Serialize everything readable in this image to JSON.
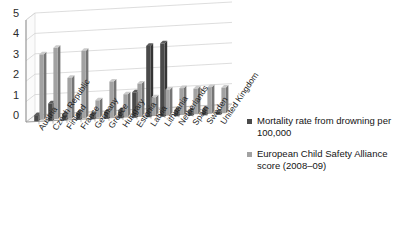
{
  "chart_data": {
    "type": "bar",
    "title": "",
    "subtitle": "",
    "xlabel": "",
    "ylabel": "",
    "ylim": [
      0,
      5
    ],
    "yticks": [
      0,
      1,
      2,
      3,
      4,
      5
    ],
    "grid": true,
    "legend_position": "right",
    "three_d": true,
    "categories": [
      "Austria",
      "Czech Republic",
      "Finland",
      "France",
      "Germany",
      "Greece",
      "Hungary",
      "Estonia",
      "Latvia",
      "Lithuania",
      "Netherlands",
      "Spain",
      "Sweden",
      "United Kingdom"
    ],
    "series": [
      {
        "name": "Mortality rate from drowning per 100,000",
        "color": "#4a4a4a",
        "values": [
          0.3,
          0.85,
          0.3,
          0.35,
          0.25,
          0.35,
          0.4,
          1.25,
          3.5,
          3.6,
          0.3,
          0.25,
          0.3,
          0.15
        ]
      },
      {
        "name": "European Child Safety Alliance score (2008–09)",
        "color": "#a2a2a2",
        "values": [
          3.2,
          3.5,
          2.0,
          3.3,
          0.85,
          1.75,
          1.1,
          1.6,
          0.9,
          1.25,
          1.3,
          1.25,
          1.3,
          1.25
        ]
      }
    ]
  },
  "legend": {
    "entries": [
      {
        "label": "Mortality rate from drowning per 100,000"
      },
      {
        "label": "European Child Safety Alliance score (2008–09)"
      }
    ]
  },
  "colors": {
    "series_dark": "#4a4a4a",
    "series_light": "#a2a2a2",
    "gridline": "#cfcfcf",
    "axis": "#9b9b9b",
    "text": "#1f1f1f",
    "background": "#ffffff"
  }
}
